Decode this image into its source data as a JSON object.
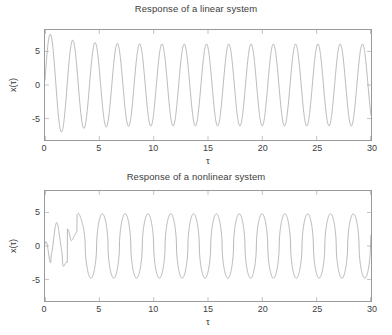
{
  "figure": {
    "background": "#ffffff",
    "axis_color": "#9a9a9a",
    "line_color": "#8a8a8a",
    "text_color": "#3d3d3d"
  },
  "chart_data": [
    {
      "type": "line",
      "title": "Response of a linear system",
      "xlabel": "τ",
      "ylabel": "x(τ)",
      "xlim": [
        0,
        30
      ],
      "ylim": [
        -8.2,
        8.2
      ],
      "xticks": [
        0,
        5,
        10,
        15,
        20,
        25,
        30
      ],
      "xticklabels": [
        "0",
        "5",
        "10",
        "15",
        "20",
        "25",
        "30"
      ],
      "yticks": [
        -5,
        0,
        5
      ],
      "yticklabels": [
        "-5",
        "0",
        "5"
      ],
      "grid": false,
      "legend": null,
      "series": [
        {
          "name": "linear response",
          "color": "#8a8a8a",
          "model": "damped-transient-sinusoid",
          "description": "Steady sinusoid of amplitude ~6 with a short starting transient: first crest ~7.2 near tau=0.85, first trough ~-7.6 near tau=2.0, settling to amplitude ~6 by tau~6.",
          "params": {
            "steady_amplitude": 6.1,
            "period": 2.05,
            "phase": 0.0,
            "transient_amplitude": 1.9,
            "transient_decay": 0.45,
            "start_value": 0.0
          },
          "sample_points": [
            {
              "x": 0.0,
              "y": 0.0
            },
            {
              "x": 0.85,
              "y": 7.2
            },
            {
              "x": 2.0,
              "y": -7.6
            },
            {
              "x": 3.0,
              "y": 4.4
            },
            {
              "x": 4.1,
              "y": -6.6
            },
            {
              "x": 5.1,
              "y": 6.4
            },
            {
              "x": 6.2,
              "y": -6.3
            },
            {
              "x": 7.2,
              "y": 6.3
            },
            {
              "x": 9.2,
              "y": 6.2
            },
            {
              "x": 11.3,
              "y": 6.2
            },
            {
              "x": 13.3,
              "y": 6.1
            },
            {
              "x": 15.4,
              "y": 6.1
            },
            {
              "x": 17.4,
              "y": 6.1
            },
            {
              "x": 19.5,
              "y": 6.1
            },
            {
              "x": 21.6,
              "y": 6.1
            },
            {
              "x": 23.6,
              "y": 6.1
            },
            {
              "x": 25.7,
              "y": 6.1
            },
            {
              "x": 27.7,
              "y": 6.1
            },
            {
              "x": 29.8,
              "y": 6.1
            },
            {
              "x": 30.0,
              "y": 4.5
            }
          ]
        }
      ]
    },
    {
      "type": "line",
      "title": "Response of a nonlinear system",
      "xlabel": "τ",
      "ylabel": "x(τ)",
      "xlim": [
        0,
        30
      ],
      "ylim": [
        -8.2,
        8.2
      ],
      "xticks": [
        0,
        5,
        10,
        15,
        20,
        25,
        30
      ],
      "xticklabels": [
        "0",
        "5",
        "10",
        "15",
        "20",
        "25",
        "30"
      ],
      "yticks": [
        -5,
        0,
        5
      ],
      "yticklabels": [
        "-5",
        "0",
        "5"
      ],
      "grid": false,
      "legend": null,
      "series": [
        {
          "name": "nonlinear response",
          "color": "#8a8a8a",
          "model": "nonlinear-limit-cycle",
          "description": "Irregular transient for tau<4 including a small shoulder plateau near tau=2.2-2.8, then a steady triangular-peaked limit cycle of amplitude ~4.7 and period ~2.1.",
          "params": {
            "steady_amplitude": 4.8,
            "period": 2.1,
            "peak_sharpness": 0.55,
            "transient_end": 4.0
          },
          "sample_points": [
            {
              "x": 0.0,
              "y": 0.0
            },
            {
              "x": 0.55,
              "y": 3.6
            },
            {
              "x": 0.8,
              "y": 2.4
            },
            {
              "x": 1.0,
              "y": 3.1
            },
            {
              "x": 1.35,
              "y": -5.6
            },
            {
              "x": 1.75,
              "y": 4.4
            },
            {
              "x": 2.2,
              "y": 1.1
            },
            {
              "x": 2.6,
              "y": 1.0
            },
            {
              "x": 2.85,
              "y": 1.2
            },
            {
              "x": 3.5,
              "y": -5.0
            },
            {
              "x": 4.0,
              "y": 5.0
            },
            {
              "x": 5.1,
              "y": -4.4
            },
            {
              "x": 6.2,
              "y": 4.6
            },
            {
              "x": 7.3,
              "y": -4.3
            },
            {
              "x": 8.4,
              "y": 4.7
            },
            {
              "x": 10.5,
              "y": 4.8
            },
            {
              "x": 12.6,
              "y": 4.7
            },
            {
              "x": 14.6,
              "y": 4.8
            },
            {
              "x": 16.7,
              "y": 4.6
            },
            {
              "x": 18.8,
              "y": 4.8
            },
            {
              "x": 20.9,
              "y": 4.7
            },
            {
              "x": 23.0,
              "y": 4.7
            },
            {
              "x": 25.1,
              "y": 4.8
            },
            {
              "x": 27.2,
              "y": 4.7
            },
            {
              "x": 29.3,
              "y": 4.8
            },
            {
              "x": 30.0,
              "y": 0.8
            }
          ]
        }
      ]
    }
  ]
}
